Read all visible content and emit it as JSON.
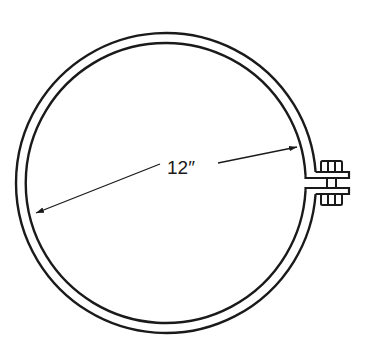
{
  "diagram": {
    "type": "pipe hanger ring / band clamp",
    "dimension": {
      "label": "12″",
      "measures": "inner diameter"
    },
    "components": [
      "ring-band",
      "flange-ears",
      "bolt",
      "nut",
      "dimension-line"
    ],
    "colors": {
      "stroke": "#1a1a1a",
      "background": "#ffffff"
    }
  }
}
